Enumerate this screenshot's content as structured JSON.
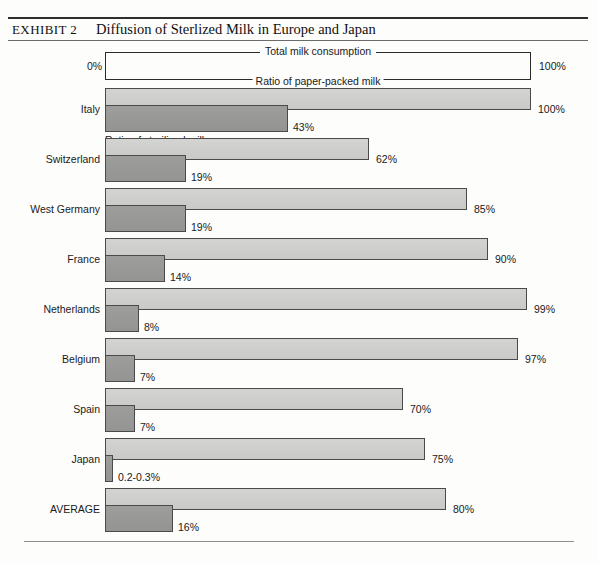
{
  "exhibit": {
    "tag": "EXHIBIT 2",
    "title": "Diffusion of Sterlized Milk in Europe and Japan"
  },
  "axis": {
    "min_label": "0%",
    "max_label": "100%"
  },
  "legend": {
    "upper_caption": "Total milk consumption",
    "lower_caption": "Ratio of paper-packed milk",
    "series_note": "Ratio of sterilized milk"
  },
  "colors": {
    "light_bar": "#cfcfcd",
    "dark_bar": "#9a9a98",
    "bar_outline": "#4a4a4a",
    "rule": "#2e2e2e",
    "text": "#1a1a1a"
  },
  "chart_data": {
    "type": "bar",
    "title": "Diffusion of Sterlized Milk in Europe and Japan",
    "orientation": "horizontal",
    "xlabel": "",
    "ylabel": "",
    "xlim": [
      0,
      100
    ],
    "grid": false,
    "legend_position": "top",
    "categories": [
      "Italy",
      "Switzerland",
      "West Germany",
      "France",
      "Netherlands",
      "Belgium",
      "Spain",
      "Japan",
      "AVERAGE"
    ],
    "series": [
      {
        "name": "Total milk consumption / Ratio of paper-packed milk",
        "values": [
          100,
          62,
          85,
          90,
          99,
          97,
          70,
          75,
          80
        ],
        "labels": [
          "100%",
          "62%",
          "85%",
          "90%",
          "99%",
          "97%",
          "70%",
          "75%",
          "80%"
        ]
      },
      {
        "name": "Ratio of sterilized milk",
        "values": [
          43,
          19,
          19,
          14,
          8,
          7,
          7,
          0.25,
          16
        ],
        "labels": [
          "43%",
          "19%",
          "19%",
          "14%",
          "8%",
          "7%",
          "7%",
          "0.2-0.3%",
          "16%"
        ]
      }
    ],
    "rows": [
      {
        "label": "Italy",
        "total": 100,
        "total_label": "100%",
        "sterilized": 43,
        "sterilized_label": "43%"
      },
      {
        "label": "Switzerland",
        "total": 62,
        "total_label": "62%",
        "sterilized": 19,
        "sterilized_label": "19%"
      },
      {
        "label": "West Germany",
        "total": 85,
        "total_label": "85%",
        "sterilized": 19,
        "sterilized_label": "19%"
      },
      {
        "label": "France",
        "total": 90,
        "total_label": "90%",
        "sterilized": 14,
        "sterilized_label": "14%"
      },
      {
        "label": "Netherlands",
        "total": 99,
        "total_label": "99%",
        "sterilized": 8,
        "sterilized_label": "8%"
      },
      {
        "label": "Belgium",
        "total": 97,
        "total_label": "97%",
        "sterilized": 7,
        "sterilized_label": "7%"
      },
      {
        "label": "Spain",
        "total": 70,
        "total_label": "70%",
        "sterilized": 7,
        "sterilized_label": "7%"
      },
      {
        "label": "Japan",
        "total": 75,
        "total_label": "75%",
        "sterilized": 0.25,
        "sterilized_label": "0.2-0.3%"
      },
      {
        "label": "AVERAGE",
        "total": 80,
        "total_label": "80%",
        "sterilized": 16,
        "sterilized_label": "16%"
      }
    ]
  }
}
